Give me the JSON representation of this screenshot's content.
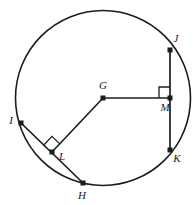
{
  "figure": {
    "stroke_color": "#1c1c1c",
    "background_color": "#ffffff"
  },
  "circle": {
    "name": "circle-G",
    "center_label": "G",
    "cx": 103,
    "cy": 98,
    "r": 87.5
  },
  "points": {
    "G": {
      "label": "G",
      "x": 103,
      "y": 98,
      "label_x": 103,
      "label_y": 89
    },
    "J": {
      "label": "J",
      "x": 170,
      "y": 50,
      "label_x": 176,
      "label_y": 42
    },
    "M": {
      "label": "M",
      "x": 170,
      "y": 98,
      "label_x": 165,
      "label_y": 110
    },
    "K": {
      "label": "K",
      "x": 170,
      "y": 150,
      "label_x": 177,
      "label_y": 161
    },
    "I": {
      "label": "I",
      "x": 21,
      "y": 123,
      "label_x": 11,
      "label_y": 121
    },
    "L": {
      "label": "L",
      "x": 52,
      "y": 152,
      "label_x": 61,
      "label_y": 159
    },
    "H": {
      "label": "H",
      "x": 83,
      "y": 183,
      "label_x": 81,
      "label_y": 198
    }
  },
  "segments": [
    {
      "name": "chord-JK",
      "from": "J",
      "to": "K"
    },
    {
      "name": "chord-IH",
      "from": "I",
      "to": "H"
    },
    {
      "name": "radius-GM",
      "from": "G",
      "to": "M"
    },
    {
      "name": "radius-GL",
      "from": "G",
      "to": "L"
    }
  ],
  "right_angles": [
    {
      "name": "right-angle-at-M",
      "at": "M",
      "size": 11
    },
    {
      "name": "right-angle-at-L",
      "at": "L",
      "size": 11
    }
  ],
  "labels_order": [
    "J",
    "G",
    "M",
    "I",
    "L",
    "K",
    "H"
  ]
}
